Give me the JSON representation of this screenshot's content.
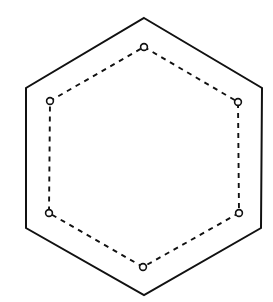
{
  "figure": {
    "background_color": "#ffffff",
    "width": 273,
    "height": 302
  },
  "chart_data": {
    "type": "scatter",
    "title": "",
    "subtitle": "",
    "xlabel": "",
    "ylabel": "",
    "xlim": [
      0,
      273
    ],
    "ylim": [
      0,
      302
    ],
    "grid": false,
    "legend": "none",
    "annotations": [],
    "tick_labels": {
      "x": [],
      "y": []
    },
    "series": [
      {
        "name": "outer-hexagon",
        "shape": "hexagon",
        "orientation": "pointy-top",
        "style": "solid",
        "stroke_color": "#111111",
        "stroke_width": 2,
        "fill": "none",
        "markers": "none",
        "closed": true,
        "points": [
          {
            "label": "top-apex",
            "x": 144,
            "y": 18
          },
          {
            "label": "upper-right",
            "x": 262,
            "y": 88
          },
          {
            "label": "lower-right",
            "x": 261,
            "y": 228
          },
          {
            "label": "bottom-apex",
            "x": 144,
            "y": 295
          },
          {
            "label": "lower-left",
            "x": 26,
            "y": 228
          },
          {
            "label": "upper-left",
            "x": 26,
            "y": 88
          }
        ]
      },
      {
        "name": "inner-hexagon",
        "shape": "hexagon",
        "orientation": "pointy-top",
        "style": "dashed",
        "dash_pattern": [
          5,
          5
        ],
        "stroke_color": "#111111",
        "stroke_width": 1.9,
        "fill": "none",
        "markers": "open-circle",
        "marker_radius": 3.4,
        "marker_fill": "#ffffff",
        "marker_stroke": "#111111",
        "closed": true,
        "points": [
          {
            "label": "top",
            "x": 144,
            "y": 47
          },
          {
            "label": "upper-right",
            "x": 238,
            "y": 102
          },
          {
            "label": "lower-right",
            "x": 239,
            "y": 213
          },
          {
            "label": "bottom",
            "x": 143,
            "y": 267
          },
          {
            "label": "lower-left",
            "x": 49,
            "y": 213
          },
          {
            "label": "upper-left",
            "x": 50,
            "y": 101
          }
        ]
      }
    ]
  }
}
